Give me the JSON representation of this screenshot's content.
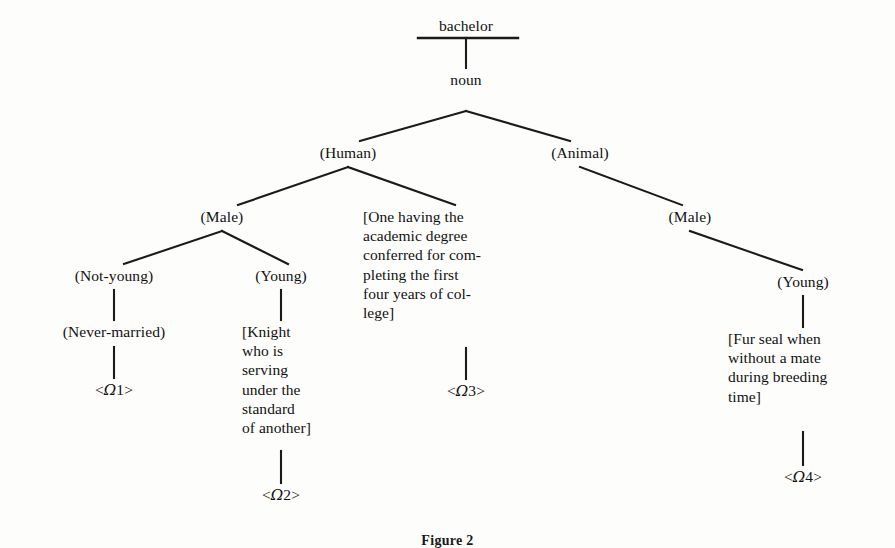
{
  "figure": {
    "title": "bachelor",
    "caption": "Figure 2"
  },
  "nodes": {
    "root": "bachelor",
    "pos": "noun",
    "human": "(Human)",
    "animal": "(Animal)",
    "male_human": "(Male)",
    "not_young": "(Not-young)",
    "young_human": "(Young)",
    "never_married": "(Never-married)",
    "male_animal": "(Male)",
    "young_animal": "(Young)",
    "gloss_degree": "[One having the\nacademic degree\nconferred for com-\npleting the first\nfour years of col-\nlege]",
    "gloss_knight": "[Knight\nwho is\nserving\nunder the\nstandard\nof another]",
    "gloss_seal": "[Fur seal when\nwithout a mate\nduring breeding\ntime]"
  },
  "senses": {
    "omega1_open": "<",
    "omega1_sym": "Ω",
    "omega1_num": "1",
    "omega1_close": ">",
    "omega2_open": "<",
    "omega2_sym": "Ω",
    "omega2_num": "2",
    "omega2_close": ">",
    "omega3_open": "<",
    "omega3_sym": "Ω",
    "omega3_num": "3",
    "omega3_close": ">",
    "omega4_open": "<",
    "omega4_sym": "Ω",
    "omega4_num": "4",
    "omega4_close": ">"
  },
  "style": {
    "ink": "#111111",
    "paper": "#fdfdfc",
    "rule_color": "#1a1a1a"
  }
}
